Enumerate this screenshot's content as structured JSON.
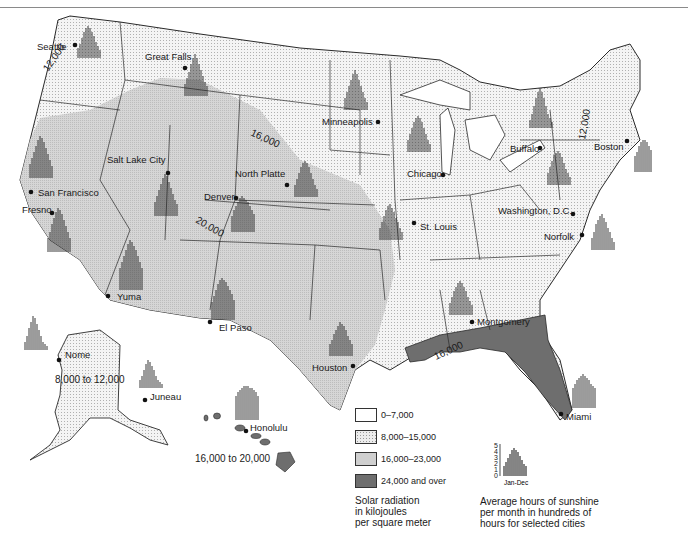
{
  "map": {
    "title": "Solar radiation and sunshine in the United States",
    "colors": {
      "zone_0_7000": "#ffffff",
      "zone_8000_15000": "#ececec",
      "zone_16000_23000": "#cfcfcf",
      "zone_24000_over": "#6e6e6e",
      "border": "#2a2a2a"
    },
    "isolines": [
      "12,000",
      "12,000",
      "16,000",
      "20,000",
      "16,000"
    ],
    "region_labels": {
      "alaska": "8,000 to 12,000",
      "hawaii": "16,000 to 20,000"
    },
    "cities": [
      {
        "name": "Seattle"
      },
      {
        "name": "Great Falls"
      },
      {
        "name": "Minneapolis"
      },
      {
        "name": "Buffalo"
      },
      {
        "name": "Boston"
      },
      {
        "name": "Chicago"
      },
      {
        "name": "North Platte"
      },
      {
        "name": "Salt Lake City"
      },
      {
        "name": "Denver"
      },
      {
        "name": "San Francisco"
      },
      {
        "name": "Fresno"
      },
      {
        "name": "Washington, D.C."
      },
      {
        "name": "St. Louis"
      },
      {
        "name": "Norfolk"
      },
      {
        "name": "Yuma"
      },
      {
        "name": "El Paso"
      },
      {
        "name": "Montgomery"
      },
      {
        "name": "Houston"
      },
      {
        "name": "Miami"
      },
      {
        "name": "Nome"
      },
      {
        "name": "Juneau"
      },
      {
        "name": "Honolulu"
      }
    ]
  },
  "legend": {
    "items": [
      {
        "label": "0–7,000",
        "color": "#ffffff"
      },
      {
        "label": "8,000–15,000",
        "color": "#ececec"
      },
      {
        "label": "16,000–23,000",
        "color": "#cfcfcf"
      },
      {
        "label": "24,000 and over",
        "color": "#6e6e6e"
      }
    ],
    "caption_lines": [
      "Solar radiation",
      "in kilojoules",
      "per square meter"
    ]
  },
  "sunshine_legend": {
    "axis_ticks": [
      "5",
      "4",
      "3",
      "2",
      "1",
      "0"
    ],
    "x_label": "Jan-Dec",
    "caption_lines": [
      "Average hours of sunshine",
      "per month in hundreds of",
      "hours for selected cities"
    ]
  }
}
